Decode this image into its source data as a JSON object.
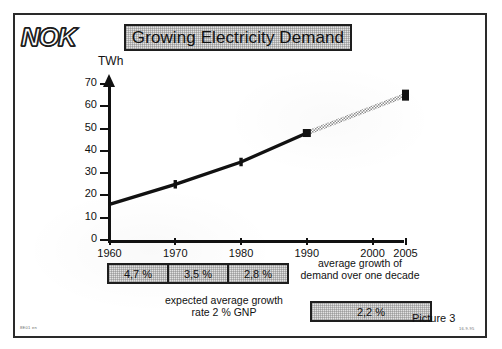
{
  "slide": {
    "logo": "NOK",
    "title": "Growing Electricity Demand",
    "picture_label": "Picture 3",
    "code_left": "8E01 en",
    "code_right": "16.9.95"
  },
  "chart_data": {
    "type": "line",
    "title": "Growing Electricity Demand",
    "xlabel": "",
    "ylabel": "TWh",
    "ylim": [
      0,
      70
    ],
    "xlim": [
      1960,
      2005
    ],
    "yticks": [
      0,
      10,
      20,
      30,
      40,
      50,
      60,
      70
    ],
    "ytick_labels": [
      "0",
      "10",
      "20",
      "30",
      "40",
      "50",
      "60",
      "70"
    ],
    "xticks": [
      1960,
      1970,
      1980,
      1990,
      2000,
      2005
    ],
    "xtick_labels": [
      "1960",
      "1970",
      "1980",
      "1990",
      "2000",
      "2005"
    ],
    "grid": false,
    "legend": "none",
    "series": [
      {
        "name": "Actual electricity demand",
        "style": "solid-black",
        "x": [
          1960,
          1970,
          1980,
          1990
        ],
        "values": [
          16,
          25,
          35,
          48
        ]
      },
      {
        "name": "Projected electricity demand",
        "style": "hatched-grey",
        "x": [
          1990,
          2005
        ],
        "values": [
          48,
          65
        ]
      }
    ]
  },
  "decade_growth": {
    "boxes": [
      {
        "period": "1960-1970",
        "value": "4,7 %"
      },
      {
        "period": "1970-1980",
        "value": "3,5 %"
      },
      {
        "period": "1980-1990",
        "value": "2,8 %"
      }
    ],
    "note": "average growth of demand over one decade"
  },
  "projection": {
    "note": "expected average growth rate 2 % GNP",
    "value": "2,2 %"
  },
  "icons": {
    "y_axis_arrow": "arrow-up-icon"
  },
  "colors": {
    "ink": "#1e1e1e",
    "box_fill": "#e2e2e2",
    "projection": "#9a9a9a",
    "paper": "#ffffff"
  }
}
